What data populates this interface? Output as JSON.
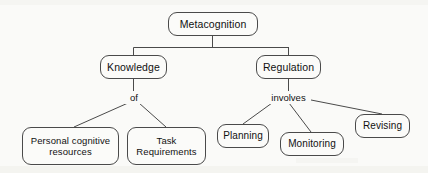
{
  "diagram": {
    "title": "Metacognition",
    "type": "concept-map",
    "background_color": "#fafaf8",
    "stroke_color": "#4a4a4a",
    "text_color": "#111111",
    "nodes": [
      {
        "id": "metacognition",
        "label": "Metacognition",
        "level": 0,
        "x": 168,
        "y": 12,
        "w": 90,
        "h": 24,
        "font_size": 10.5
      },
      {
        "id": "knowledge",
        "label": "Knowledge",
        "level": 1,
        "x": 100,
        "y": 55,
        "w": 67,
        "h": 24,
        "font_size": 10.5
      },
      {
        "id": "regulation",
        "label": "Regulation",
        "level": 1,
        "x": 256,
        "y": 55,
        "w": 65,
        "h": 24,
        "font_size": 10.5
      },
      {
        "id": "personal-cognitive-resources",
        "label": "Personal cognitive\nresources",
        "level": 2,
        "x": 22,
        "y": 127,
        "w": 97,
        "h": 38,
        "font_size": 9.5
      },
      {
        "id": "task-requirements",
        "label": "Task\nRequirements",
        "level": 2,
        "x": 127,
        "y": 127,
        "w": 79,
        "h": 38,
        "font_size": 9.5
      },
      {
        "id": "planning",
        "label": "Planning",
        "level": 2,
        "x": 217,
        "y": 124,
        "w": 52,
        "h": 24,
        "font_size": 10
      },
      {
        "id": "monitoring",
        "label": "Monitoring",
        "level": 2,
        "x": 280,
        "y": 132,
        "w": 64,
        "h": 24,
        "font_size": 10
      },
      {
        "id": "revising",
        "label": "Revising",
        "level": 2,
        "x": 355,
        "y": 114,
        "w": 55,
        "h": 24,
        "font_size": 10
      }
    ],
    "edge_labels": [
      {
        "id": "of",
        "text": "of",
        "from": "knowledge",
        "x": 133,
        "y": 97,
        "font_size": 9.5
      },
      {
        "id": "involves",
        "text": "involves",
        "from": "regulation",
        "x": 288,
        "y": 97,
        "font_size": 9.5
      }
    ],
    "edges": [
      {
        "id": "metacognition-bus-drop",
        "from": "metacognition",
        "to": "bus",
        "shape": "orthogonal"
      },
      {
        "id": "metacognition-knowledge",
        "from": "metacognition",
        "to": "knowledge",
        "shape": "orthogonal"
      },
      {
        "id": "metacognition-regulation",
        "from": "metacognition",
        "to": "regulation",
        "shape": "orthogonal"
      },
      {
        "id": "knowledge-of",
        "from": "knowledge",
        "to": "of",
        "shape": "straight"
      },
      {
        "id": "of-personal-cognitive-resources",
        "from": "of",
        "to": "personal-cognitive-resources",
        "shape": "diagonal"
      },
      {
        "id": "of-task-requirements",
        "from": "of",
        "to": "task-requirements",
        "shape": "diagonal"
      },
      {
        "id": "regulation-involves",
        "from": "regulation",
        "to": "involves",
        "shape": "straight"
      },
      {
        "id": "involves-planning",
        "from": "involves",
        "to": "planning",
        "shape": "diagonal"
      },
      {
        "id": "involves-monitoring",
        "from": "involves",
        "to": "monitoring",
        "shape": "diagonal"
      },
      {
        "id": "involves-revising",
        "from": "involves",
        "to": "revising",
        "shape": "diagonal"
      }
    ]
  }
}
